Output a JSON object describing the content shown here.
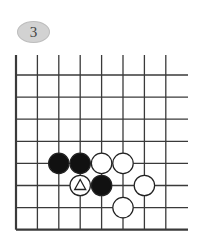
{
  "problem": {
    "number": "3"
  },
  "board": {
    "columns": 8,
    "rows": 8,
    "open_edges": [
      "top",
      "right"
    ],
    "closed_edges": [
      "left",
      "bottom"
    ],
    "stones": [
      {
        "color": "black",
        "col": 2,
        "row": 4,
        "marker": ""
      },
      {
        "color": "black",
        "col": 3,
        "row": 4,
        "marker": ""
      },
      {
        "color": "white",
        "col": 4,
        "row": 4,
        "marker": ""
      },
      {
        "color": "white",
        "col": 5,
        "row": 4,
        "marker": ""
      },
      {
        "color": "white",
        "col": 3,
        "row": 5,
        "marker": "triangle"
      },
      {
        "color": "black",
        "col": 4,
        "row": 5,
        "marker": ""
      },
      {
        "color": "white",
        "col": 6,
        "row": 5,
        "marker": ""
      },
      {
        "color": "white",
        "col": 5,
        "row": 6,
        "marker": ""
      }
    ]
  },
  "colors": {
    "line": "#3a3a3a",
    "black_stone": "#111111",
    "white_stone": "#ffffff",
    "bubble_fill": "#d2d2d2"
  }
}
